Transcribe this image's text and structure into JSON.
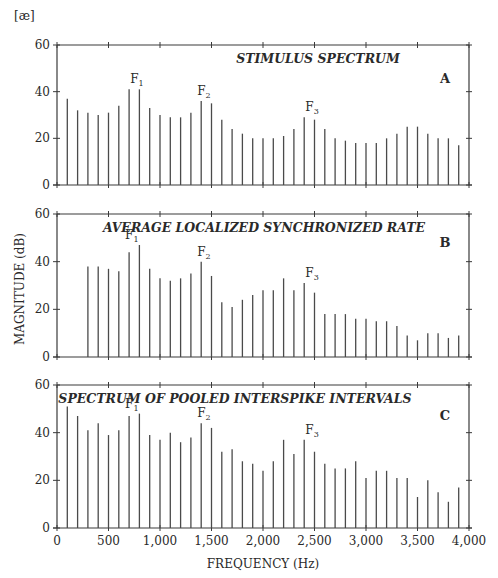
{
  "figure": {
    "vowel_label": "[æ]",
    "ylabel": "MAGNITUDE (dB)",
    "xlabel": "FREQUENCY (Hz)",
    "x_ticks": [
      "0",
      "500",
      "1,000",
      "1,500",
      "2,000",
      "2,500",
      "3,000",
      "3,500",
      "4,000"
    ],
    "y_ticks": [
      "0",
      "20",
      "40",
      "60"
    ],
    "colors": {
      "bars": "#4a4a4a",
      "axis": "#3a3a3a",
      "text": "#2a2a2a"
    }
  },
  "panels": [
    {
      "letter": "A",
      "title": "STIMULUS SPECTRUM",
      "formants": [
        {
          "label": "F",
          "sub": "1",
          "freq": 750
        },
        {
          "label": "F",
          "sub": "2",
          "freq": 1400
        },
        {
          "label": "F",
          "sub": "3",
          "freq": 2450
        }
      ]
    },
    {
      "letter": "B",
      "title": "AVERAGE LOCALIZED SYNCHRONIZED RATE",
      "formants": [
        {
          "label": "F",
          "sub": "1",
          "freq": 700
        },
        {
          "label": "F",
          "sub": "2",
          "freq": 1400
        },
        {
          "label": "F",
          "sub": "3",
          "freq": 2450
        }
      ]
    },
    {
      "letter": "C",
      "title": "SPECTRUM OF POOLED INTERSPIKE INTERVALS",
      "formants": [
        {
          "label": "F",
          "sub": "1",
          "freq": 700
        },
        {
          "label": "F",
          "sub": "2",
          "freq": 1400
        },
        {
          "label": "F",
          "sub": "3",
          "freq": 2450
        }
      ]
    }
  ],
  "chart_data": [
    {
      "type": "bar",
      "title": "STIMULUS SPECTRUM",
      "panel": "A",
      "xlabel": "FREQUENCY (Hz)",
      "ylabel": "MAGNITUDE (dB)",
      "xlim": [
        0,
        4000
      ],
      "ylim": [
        0,
        60
      ],
      "x": [
        100,
        200,
        300,
        400,
        500,
        600,
        700,
        800,
        900,
        1000,
        1100,
        1200,
        1300,
        1400,
        1500,
        1600,
        1700,
        1800,
        1900,
        2000,
        2100,
        2200,
        2300,
        2400,
        2500,
        2600,
        2700,
        2800,
        2900,
        3000,
        3100,
        3200,
        3300,
        3400,
        3500,
        3600,
        3700,
        3800,
        3900
      ],
      "values": [
        37,
        32,
        31,
        30,
        31,
        34,
        41,
        41,
        33,
        30,
        29,
        29,
        31,
        36,
        35,
        28,
        24,
        22,
        20,
        20,
        20,
        21,
        24,
        29,
        28,
        24,
        20,
        19,
        18,
        18,
        18,
        20,
        22,
        25,
        25,
        22,
        20,
        20,
        17
      ],
      "annotations": [
        "F1",
        "F2",
        "F3"
      ],
      "grid": false
    },
    {
      "type": "bar",
      "title": "AVERAGE LOCALIZED SYNCHRONIZED RATE",
      "panel": "B",
      "xlabel": "FREQUENCY (Hz)",
      "ylabel": "MAGNITUDE (dB)",
      "xlim": [
        0,
        4000
      ],
      "ylim": [
        0,
        60
      ],
      "x": [
        300,
        400,
        500,
        600,
        700,
        800,
        900,
        1000,
        1100,
        1200,
        1300,
        1400,
        1500,
        1600,
        1700,
        1800,
        1900,
        2000,
        2100,
        2200,
        2300,
        2400,
        2500,
        2600,
        2700,
        2800,
        2900,
        3000,
        3100,
        3200,
        3300,
        3400,
        3500,
        3600,
        3700,
        3800,
        3900
      ],
      "values": [
        38,
        38,
        37,
        36,
        44,
        47,
        37,
        33,
        32,
        33,
        35,
        40,
        34,
        23,
        21,
        24,
        26,
        28,
        28,
        33,
        28,
        31,
        27,
        18,
        18,
        18,
        16,
        16,
        15,
        15,
        13,
        9,
        7,
        10,
        10,
        8,
        9
      ],
      "annotations": [
        "F1",
        "F2",
        "F3"
      ],
      "grid": false
    },
    {
      "type": "bar",
      "title": "SPECTRUM OF POOLED INTERSPIKE INTERVALS",
      "panel": "C",
      "xlabel": "FREQUENCY (Hz)",
      "ylabel": "MAGNITUDE (dB)",
      "xlim": [
        0,
        4000
      ],
      "ylim": [
        0,
        60
      ],
      "x": [
        100,
        200,
        300,
        400,
        500,
        600,
        700,
        800,
        900,
        1000,
        1100,
        1200,
        1300,
        1400,
        1500,
        1600,
        1700,
        1800,
        1900,
        2000,
        2100,
        2200,
        2300,
        2400,
        2500,
        2600,
        2700,
        2800,
        2900,
        3000,
        3100,
        3200,
        3300,
        3400,
        3500,
        3600,
        3700,
        3800,
        3900
      ],
      "values": [
        51,
        47,
        41,
        44,
        39,
        41,
        47,
        48,
        39,
        37,
        40,
        36,
        38,
        44,
        42,
        32,
        33,
        28,
        27,
        24,
        28,
        37,
        31,
        37,
        32,
        27,
        25,
        25,
        28,
        21,
        24,
        24,
        21,
        21,
        13,
        20,
        15,
        11,
        17
      ],
      "annotations": [
        "F1",
        "F2",
        "F3"
      ],
      "grid": false
    }
  ]
}
